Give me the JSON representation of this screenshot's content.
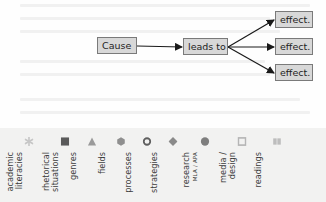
{
  "diagram": {
    "cause": "Cause",
    "link": "leads to",
    "effects": [
      "effect.",
      "effect.",
      "effect."
    ],
    "colors": {
      "box_fill": "#d8d8d8",
      "box_border": "#7a7a7a",
      "arrow": "#1a1a1a"
    }
  },
  "legend": {
    "background": "#f2f2f1",
    "items": [
      {
        "line1": "academic",
        "line2": "literacies",
        "icon": "asterisk-icon",
        "color": "#c6c6c6"
      },
      {
        "line1": "rhetorical",
        "line2": "situations",
        "icon": "square-icon",
        "color": "#5a5a5a"
      },
      {
        "line1": "genres",
        "line2": "",
        "icon": "triangle-icon",
        "color": "#9a9a9a"
      },
      {
        "line1": "fields",
        "line2": "",
        "icon": "hexagon-icon",
        "color": "#8f8f8f"
      },
      {
        "line1": "processes",
        "line2": "",
        "icon": "ring-icon",
        "color": "#5f5f5f"
      },
      {
        "line1": "strategies",
        "line2": "",
        "icon": "diamond-icon",
        "color": "#8a8a8a"
      },
      {
        "line1": "research",
        "line2": "MLA / APA",
        "icon": "circle-icon",
        "color": "#7e7e7e"
      },
      {
        "line1": "media /",
        "line2": "design",
        "icon": "hollow-square-icon",
        "color": "#b5b5b5"
      },
      {
        "line1": "readings",
        "line2": "",
        "icon": "book-icon",
        "color": "#bdbdbd"
      }
    ]
  }
}
